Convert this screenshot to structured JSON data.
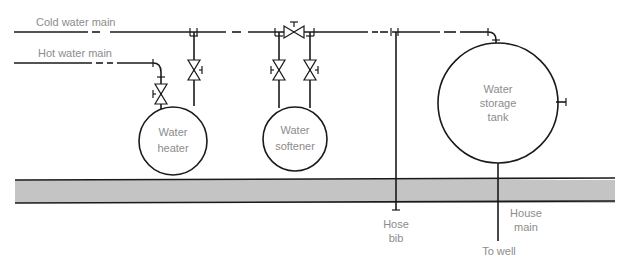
{
  "diagram": {
    "type": "plumbing-schematic",
    "labels": {
      "cold_main": "Cold water main",
      "hot_main": "Hot water main",
      "heater_l1": "Water",
      "heater_l2": "heater",
      "softener_l1": "Water",
      "softener_l2": "softener",
      "storage_l1": "Water",
      "storage_l2": "storage",
      "storage_l3": "tank",
      "hose_l1": "Hose",
      "hose_l2": "bib",
      "house_l1": "House",
      "house_l2": "main",
      "to_well": "To well"
    },
    "components": [
      {
        "id": "water-heater",
        "shape": "circle"
      },
      {
        "id": "water-softener",
        "shape": "circle"
      },
      {
        "id": "water-storage-tank",
        "shape": "circle"
      },
      {
        "id": "hose-bib",
        "shape": "pipe-end"
      },
      {
        "id": "bypass-valve",
        "shape": "gate-valve"
      }
    ],
    "colors": {
      "line": "#1a1a1a",
      "label": "#8c8c8c",
      "floor": "#c4c4c4"
    }
  }
}
